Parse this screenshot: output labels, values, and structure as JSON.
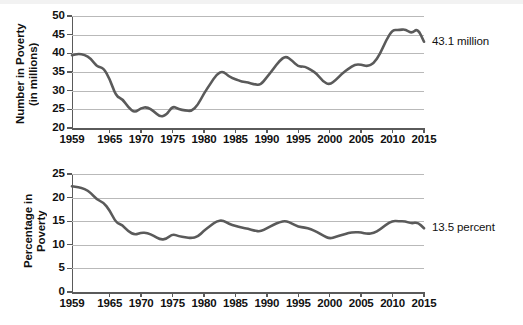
{
  "figure": {
    "background": "#ffffff",
    "line_color": "#5a5a5a",
    "grid_color": "#b9b9b9",
    "axis_color": "#5a5a5a"
  },
  "chart_data": [
    {
      "type": "line",
      "id": "number-in-poverty",
      "title": "",
      "xlabel": "",
      "ylabel": "Number in Poverty (in millions)",
      "ylabel_line1": "Number in Poverty",
      "ylabel_line2": "(in millions)",
      "xlim": [
        1959,
        2015
      ],
      "ylim": [
        20,
        50
      ],
      "yticks": [
        20,
        25,
        30,
        35,
        40,
        45,
        50
      ],
      "ytick_labels": [
        "20",
        "25",
        "30",
        "35",
        "40",
        "45",
        "50"
      ],
      "xticks": [
        1959,
        1965,
        1970,
        1975,
        1980,
        1985,
        1990,
        1995,
        2000,
        2005,
        2010,
        2015
      ],
      "xtick_labels": [
        "1959",
        "1965",
        "1970",
        "1975",
        "1980",
        "1985",
        "1990",
        "1995",
        "2000",
        "2005",
        "2010",
        "2015"
      ],
      "grid": "horizontal",
      "legend": "none",
      "annotation": "43.1 million",
      "annotation_value": 43.1,
      "annotation_year": 2015,
      "x": [
        1959,
        1960,
        1961,
        1962,
        1963,
        1964,
        1965,
        1966,
        1967,
        1968,
        1969,
        1970,
        1971,
        1972,
        1973,
        1974,
        1975,
        1976,
        1977,
        1978,
        1979,
        1980,
        1981,
        1982,
        1983,
        1984,
        1985,
        1986,
        1987,
        1988,
        1989,
        1990,
        1991,
        1992,
        1993,
        1994,
        1995,
        1996,
        1997,
        1998,
        1999,
        2000,
        2001,
        2002,
        2003,
        2004,
        2005,
        2006,
        2007,
        2008,
        2009,
        2010,
        2011,
        2012,
        2013,
        2014,
        2015
      ],
      "values": [
        39.5,
        39.9,
        39.6,
        38.6,
        36.4,
        36.1,
        33.2,
        28.5,
        27.8,
        25.4,
        24.1,
        25.4,
        25.6,
        24.5,
        23.0,
        23.4,
        25.9,
        25.0,
        24.7,
        24.5,
        26.1,
        29.3,
        31.8,
        34.4,
        35.3,
        33.7,
        33.1,
        32.4,
        32.2,
        31.7,
        31.5,
        33.6,
        35.7,
        38.0,
        39.3,
        38.1,
        36.4,
        36.5,
        35.6,
        34.5,
        32.3,
        31.6,
        32.9,
        34.6,
        35.9,
        37.0,
        37.0,
        36.5,
        37.3,
        39.8,
        43.6,
        46.3,
        46.2,
        46.5,
        45.3,
        46.7,
        43.1
      ],
      "units": "millions"
    },
    {
      "type": "line",
      "id": "percentage-in-poverty",
      "title": "",
      "xlabel": "",
      "ylabel": "Percentage in Poverty",
      "ylabel_line1": "Percentage in Poverty",
      "ylabel_line2": "",
      "xlim": [
        1959,
        2015
      ],
      "ylim": [
        0,
        25
      ],
      "yticks": [
        0,
        5,
        10,
        15,
        20,
        25
      ],
      "ytick_labels": [
        "0",
        "5",
        "10",
        "15",
        "20",
        "25"
      ],
      "xticks": [
        1959,
        1965,
        1970,
        1975,
        1980,
        1985,
        1990,
        1995,
        2000,
        2005,
        2010,
        2015
      ],
      "xtick_labels": [
        "1959",
        "1965",
        "1970",
        "1975",
        "1980",
        "1985",
        "1990",
        "1995",
        "2000",
        "2005",
        "2010",
        "2015"
      ],
      "grid": "horizontal",
      "legend": "none",
      "annotation": "13.5 percent",
      "annotation_value": 13.5,
      "annotation_year": 2015,
      "x": [
        1959,
        1960,
        1961,
        1962,
        1963,
        1964,
        1965,
        1966,
        1967,
        1968,
        1969,
        1970,
        1971,
        1972,
        1973,
        1974,
        1975,
        1976,
        1977,
        1978,
        1979,
        1980,
        1981,
        1982,
        1983,
        1984,
        1985,
        1986,
        1987,
        1988,
        1989,
        1990,
        1991,
        1992,
        1993,
        1994,
        1995,
        1996,
        1997,
        1998,
        1999,
        2000,
        2001,
        2002,
        2003,
        2004,
        2005,
        2006,
        2007,
        2008,
        2009,
        2010,
        2011,
        2012,
        2013,
        2014,
        2015
      ],
      "values": [
        22.4,
        22.2,
        21.9,
        21.0,
        19.5,
        19.0,
        17.3,
        14.7,
        14.2,
        12.8,
        12.1,
        12.6,
        12.5,
        11.9,
        11.1,
        11.2,
        12.3,
        11.8,
        11.6,
        11.4,
        11.7,
        13.0,
        14.0,
        15.0,
        15.2,
        14.4,
        14.0,
        13.6,
        13.4,
        13.0,
        12.8,
        13.5,
        14.2,
        14.8,
        15.1,
        14.5,
        13.8,
        13.7,
        13.3,
        12.7,
        11.9,
        11.3,
        11.7,
        12.1,
        12.5,
        12.7,
        12.6,
        12.3,
        12.5,
        13.2,
        14.3,
        15.1,
        15.0,
        15.0,
        14.5,
        14.8,
        13.5
      ],
      "units": "percent"
    }
  ]
}
